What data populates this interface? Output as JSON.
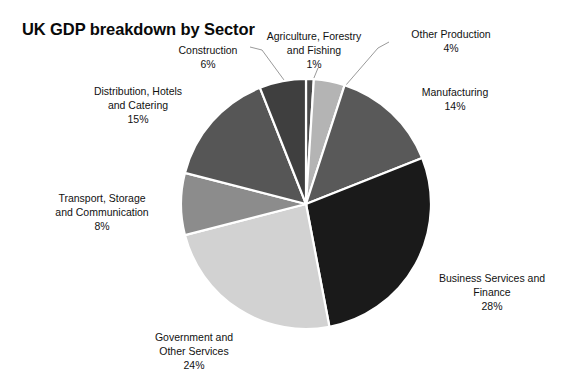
{
  "chart_data": {
    "type": "pie",
    "title": "UK GDP breakdown by Sector",
    "xlabel": "",
    "ylabel": "",
    "legend_position": "none",
    "grid": false,
    "value_unit": "%",
    "total": 100,
    "categories": [
      "Agriculture, Forestry and Fishing",
      "Other Production",
      "Manufacturing",
      "Business Services and Finance",
      "Government and Other Services",
      "Transport, Storage and Communication",
      "Distribution, Hotels and Catering",
      "Construction"
    ],
    "values": [
      1,
      4,
      14,
      28,
      24,
      8,
      15,
      6
    ],
    "colors": [
      "#4a4a4a",
      "#b4b4b4",
      "#595959",
      "#1a1a1a",
      "#d2d2d2",
      "#8c8c8c",
      "#565656",
      "#3f3f3f"
    ]
  },
  "title": "UK GDP breakdown by Sector",
  "slices": [
    {
      "name": "Agriculture, Forestry and Fishing",
      "label": "Agriculture, Forestry\nand Fishing\n1%",
      "value": 1,
      "percent_text": "1%",
      "color": "#4a4a4a"
    },
    {
      "name": "Other Production",
      "label": "Other Production\n4%",
      "value": 4,
      "percent_text": "4%",
      "color": "#b4b4b4"
    },
    {
      "name": "Manufacturing",
      "label": "Manufacturing\n14%",
      "value": 14,
      "percent_text": "14%",
      "color": "#595959"
    },
    {
      "name": "Business Services and Finance",
      "label": "Business Services and\nFinance\n28%",
      "value": 28,
      "percent_text": "28%",
      "color": "#1a1a1a"
    },
    {
      "name": "Government and Other Services",
      "label": "Government and\nOther Services\n24%",
      "value": 24,
      "percent_text": "24%",
      "color": "#d2d2d2"
    },
    {
      "name": "Transport, Storage and Communication",
      "label": "Transport, Storage\nand Communication\n8%",
      "value": 8,
      "percent_text": "8%",
      "color": "#8c8c8c"
    },
    {
      "name": "Distribution, Hotels and Catering",
      "label": "Distribution, Hotels\nand Catering\n15%",
      "value": 15,
      "percent_text": "15%",
      "color": "#565656"
    },
    {
      "name": "Construction",
      "label": "Construction\n6%",
      "value": 6,
      "percent_text": "6%",
      "color": "#3f3f3f"
    }
  ]
}
